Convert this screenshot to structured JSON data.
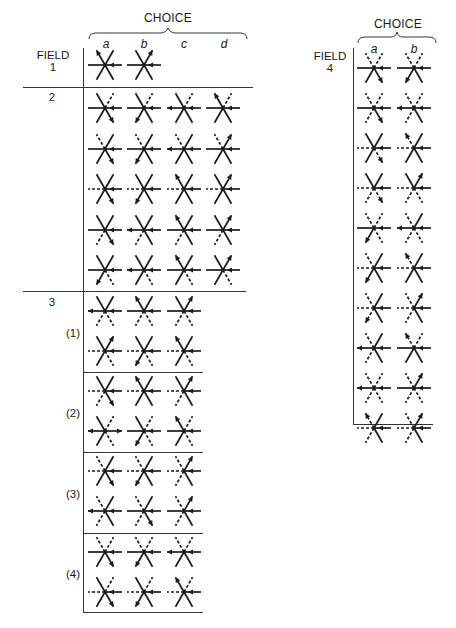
{
  "legend": {
    "spoke_order": [
      "E",
      "W",
      "NE",
      "SW",
      "NW",
      "SE"
    ],
    "codes": {
      "s": "solid",
      "d": "dashed",
      "<": "arrow-in",
      ">": "arrow-out"
    }
  },
  "left_panel": {
    "choice_title": "CHOICE",
    "columns": [
      "a",
      "b",
      "c",
      "d"
    ],
    "field_header": "FIELD",
    "fields": [
      {
        "label": "1",
        "rows": [
          [
            "s<,s,s,s,s>,s",
            "s<,s,s>,s,s,s"
          ]
        ]
      },
      {
        "label": "2",
        "rows": [
          [
            "s<,s,d,s,s,s>",
            "s<,s,d,s>,s,s",
            "s<,s>,d,s,s,s",
            "s<,s,d,s,s>,s"
          ],
          [
            "s<,s,s,s,d,s>",
            "s<,s,s,s>,d,s",
            "s<,s>,s,s,d,s",
            "s<,s,s>,s,d,s"
          ],
          [
            "s<,d,s,s,s,s>",
            "s<,d,s,s>,s,s",
            "s<,d,s,s,s>,s",
            "s<,d,s>,s,s,s"
          ],
          [
            "s<,s,s,d,s,s>",
            "s<,s>,s,d,s,s",
            "s<,s,s,d,s>,s",
            "s<,s,s>,d,s,s"
          ],
          [
            "s<,s,s,s>,s,d",
            "s<,s>,s,s,s,d",
            "s<,s,s,s,s>,d",
            "s<,s,s>,s,s,d"
          ]
        ]
      },
      {
        "label": "3",
        "sections": [
          {
            "label": "(1)",
            "rows": [
              [
                "s<,s>,s,d,s,d",
                "s<,s,s,d,s>,d",
                "s<,s,s>,d,s,d"
              ],
              [
                "s<,d,s>,s,s,d",
                "s<,d,s,s>,s,d",
                "s<,d,s,s,s>,d"
              ]
            ]
          },
          {
            "label": "(2)",
            "rows": [
              [
                "s<,d,s,d,s,s>",
                "s<,d,s,s,s>,s",
                "s<,d,s>,d,s,s"
              ],
              [
                "s>,s>,d,s,s,d",
                "s<,s,d,s>,s,d",
                "s<,s,d,s,s>,d"
              ]
            ]
          },
          {
            "label": "(3)",
            "rows": [
              [
                "s<,d,s,s,d,s>",
                "s<,d,s,s>,d,s",
                "s<,d,s>,d,d,s"
              ],
              [
                "s<,s>,s,d,d,s",
                "s<,s,s,d,d,s>",
                "s<,s,s>,d,d,s"
              ]
            ]
          },
          {
            "label": "(4)",
            "rows": [
              [
                "s<,s,d,s,d,s>",
                "s<,s,d,s>,d,s",
                "s<,s>,d,s,d,s"
              ],
              [
                "s<,d,d,s,s,s>",
                "s<,d,d,s>,s,s",
                "s<,d,d,s,s>,s"
              ]
            ]
          }
        ]
      }
    ]
  },
  "right_panel": {
    "choice_title": "CHOICE",
    "columns": [
      "a",
      "b"
    ],
    "field_header": "FIELD",
    "field_label": "4",
    "rows": [
      [
        "s<,s,d,s,d,s>",
        "s<,s,d,s>,d,s"
      ],
      [
        "s<,s,d,d,d,s>",
        "s<,s>,d,d,d,s"
      ],
      [
        "s<,d,s,s,s,d>",
        "s<,d,s,s,d>,s"
      ],
      [
        "s<,d,s,d,s,d>",
        "s<,d,s>,d,s,d"
      ],
      [
        "s<,s,d,s>,d,d",
        "s<,s>,s,d,d,d"
      ],
      [
        "s<,d,s,s>,d,s",
        "s<,d,s,s,d>,s"
      ],
      [
        "s<,d,s,d>,d,s",
        "s<,d,s>,d,d,s"
      ],
      [
        "s<,s>,s,d,d,s",
        "s<,s,d,s,d>,s"
      ],
      [
        "s<,s>,d,d,d,d",
        "s<,s,s>,d,d,d"
      ],
      [
        "s<,d,s,d,d>,s",
        "s<,d,s>,d,d,s"
      ]
    ]
  }
}
